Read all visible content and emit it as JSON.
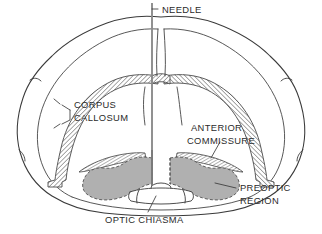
{
  "figure": {
    "type": "anatomical-diagram",
    "background_color": "#ffffff",
    "outline_color": "#3a3a3a",
    "hatch_color": "#4a4a4a",
    "shade_color": "#b0b0b0",
    "needle_color": "#8c8c8c",
    "text_color": "#2b2b2b"
  },
  "labels": {
    "needle": "NEEDLE",
    "corpus_callosum_line1": "CORPUS",
    "corpus_callosum_line2": "CALLOSUM",
    "anterior_commissure_line1": "ANTERIOR",
    "anterior_commissure_line2": "COMMISSURE",
    "preoptic_region_line1": "PREOPTIC",
    "preoptic_region_line2": "REGION",
    "optic_chiasma": "OPTIC  CHIASMA"
  },
  "structures": [
    {
      "name": "cortex-outline",
      "fill": "none",
      "stroke": "#3a3a3a"
    },
    {
      "name": "corpus-callosum",
      "fill": "hatched",
      "stroke": "#4a4a4a"
    },
    {
      "name": "anterior-commissure",
      "fill": "hatched",
      "stroke": "#4a4a4a"
    },
    {
      "name": "preoptic-region",
      "fill": "#b0b0b0",
      "stroke": "#4a4a4a"
    },
    {
      "name": "optic-chiasma",
      "fill": "none",
      "stroke": "#3a3a3a"
    },
    {
      "name": "needle",
      "fill": "#8c8c8c",
      "stroke": "#8c8c8c"
    }
  ]
}
